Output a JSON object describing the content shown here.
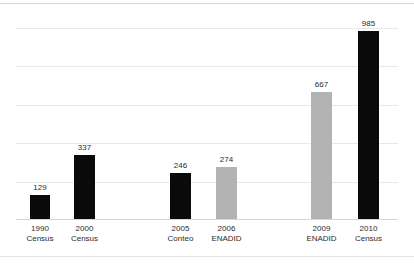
{
  "chart_data": {
    "type": "bar",
    "title": "",
    "subtitle": "",
    "xlabel": "",
    "ylabel": "",
    "categories": [
      "1990 Census",
      "2000 Census",
      "2005 Conteo",
      "2006 ENADID",
      "2009 ENADID",
      "2010 Census"
    ],
    "values": [
      129,
      337,
      246,
      274,
      667,
      985
    ],
    "data_labels": [
      "129",
      "337",
      "246",
      "274",
      "667",
      "985"
    ],
    "series": [
      {
        "name": "",
        "values": [
          129,
          337,
          246,
          274,
          667,
          985
        ]
      }
    ],
    "bars": [
      {
        "year": "1990",
        "source": "Census",
        "value": 129,
        "value_label": "129",
        "color": "#0a0a0a",
        "group": 1
      },
      {
        "year": "2000",
        "source": "Census",
        "value": 337,
        "value_label": "337",
        "color": "#0a0a0a",
        "group": 1
      },
      {
        "year": "2005",
        "source": "Conteo",
        "value": 246,
        "value_label": "246",
        "color": "#0a0a0a",
        "group": 2
      },
      {
        "year": "2006",
        "source": "ENADID",
        "value": 274,
        "value_label": "274",
        "color": "#b3b3b3",
        "group": 2
      },
      {
        "year": "2009",
        "source": "ENADID",
        "value": 667,
        "value_label": "667",
        "color": "#b3b3b3",
        "group": 3
      },
      {
        "year": "2010",
        "source": "Census",
        "value": 985,
        "value_label": "985",
        "color": "#0a0a0a",
        "group": 3
      }
    ],
    "ylim": [
      0,
      1050
    ],
    "gridlines": [
      200,
      400,
      600,
      800,
      1000
    ],
    "grid": true,
    "y_tick_labels_visible": false,
    "legend": "none",
    "legend_position": "none",
    "colors": {
      "census_conteo": "#0a0a0a",
      "enadid": "#b3b3b3",
      "gridline": "#e8e8e8",
      "axis": "#d6d6d6",
      "text": "#2b2b2b",
      "background": "#ffffff"
    }
  }
}
